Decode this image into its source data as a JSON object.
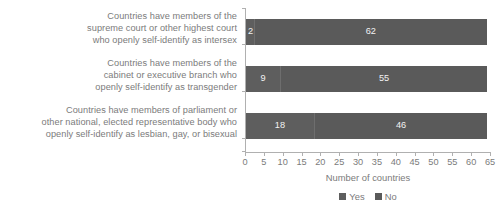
{
  "chart_data": {
    "type": "bar",
    "subtype": "horizontal-stacked-bar",
    "title": "",
    "xlabel": "Number of countries",
    "ylabel": "",
    "xlim": [
      0,
      65
    ],
    "xticks": [
      0,
      5,
      10,
      15,
      20,
      25,
      30,
      35,
      40,
      45,
      50,
      55,
      60,
      65
    ],
    "xtick_labels": [
      "0",
      "5",
      "10",
      "15",
      "20",
      "25",
      "30",
      "35",
      "40",
      "45",
      "50",
      "55",
      "60",
      "65"
    ],
    "grid": false,
    "legend_position": "bottom-center",
    "legend": [
      "Yes",
      "No"
    ],
    "categories": [
      {
        "lines": [
          "Countries have members of the",
          "supreme court or other highest court",
          "who openly self-identify as intersex"
        ]
      },
      {
        "lines": [
          "Countries have members of the",
          "cabinet or executive branch who",
          "openly self-identify as transgender"
        ]
      },
      {
        "lines": [
          "Countries have members of parliament or",
          "other national, elected representative body who",
          "openly self-identify as lesbian, gay, or bisexual"
        ]
      }
    ],
    "series": [
      {
        "name": "Yes",
        "color": "#5e5e5e",
        "values": [
          2,
          9,
          18
        ]
      },
      {
        "name": "No",
        "color": "#5a5a5a",
        "values": [
          62,
          55,
          46
        ]
      }
    ],
    "bar_totals": [
      64,
      64,
      64
    ]
  },
  "colors": {
    "yes": "#5e5e5e",
    "no": "#5a5a5a",
    "text": "#7b7b7b",
    "axis": "#b0b0b0",
    "value_text": "#f2f2f2",
    "background": "#ffffff"
  }
}
